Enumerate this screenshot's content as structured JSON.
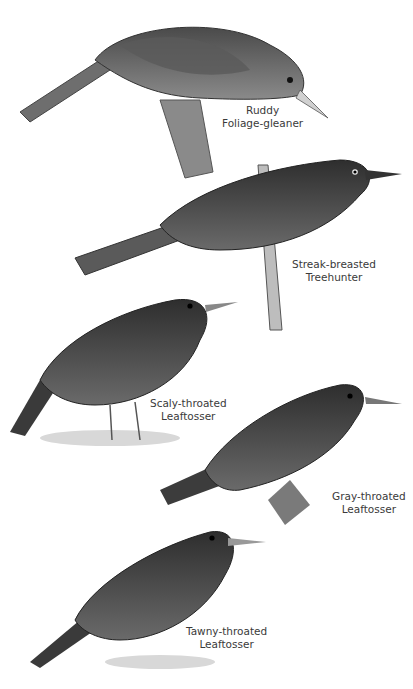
{
  "plate": {
    "birds": [
      {
        "id": "ruddy-foliage-gleaner",
        "line1": "Ruddy",
        "line2": "Foliage-gleaner"
      },
      {
        "id": "streak-breasted-treehunter",
        "line1": "Streak-breasted",
        "line2": "Treehunter"
      },
      {
        "id": "scaly-throated-leaftosser",
        "line1": "Scaly-throated",
        "line2": "Leaftosser"
      },
      {
        "id": "gray-throated-leaftosser",
        "line1": "Gray-throated",
        "line2": "Leaftosser"
      },
      {
        "id": "tawny-throated-leaftosser",
        "line1": "Tawny-throated",
        "line2": "Leaftosser"
      }
    ]
  }
}
